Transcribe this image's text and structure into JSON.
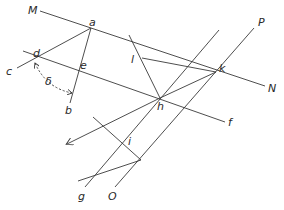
{
  "labels": {
    "M": "M",
    "N": "N",
    "P": "P",
    "O": "O",
    "a": "a",
    "b": "b",
    "c": "c",
    "d": "d",
    "e": "e",
    "f": "f",
    "g": "g",
    "h": "h",
    "i": "i",
    "k": "k",
    "l": "l",
    "delta": "δ"
  },
  "colors": {
    "line": "#3a3a3a",
    "text": "#2a2a2a",
    "background": "#ffffff"
  }
}
